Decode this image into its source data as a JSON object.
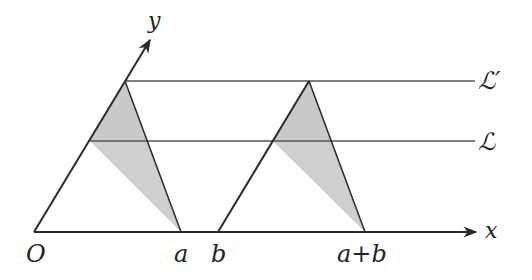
{
  "diagram": {
    "axes": {
      "x_label": "x",
      "y_label": "y",
      "origin_label": "O"
    },
    "tick_labels": {
      "a": "a",
      "b": "b",
      "a_plus_b": "a+b"
    },
    "lines": {
      "L_prime": "ℒ′",
      "L": "ℒ"
    },
    "colors": {
      "stroke": "#2a2a2a",
      "shade": "#c8c8c8",
      "background": "#ffffff"
    }
  }
}
